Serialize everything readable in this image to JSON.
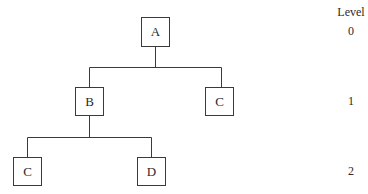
{
  "diagram": {
    "type": "tree",
    "nodes": [
      {
        "id": "A",
        "label": "A",
        "level": 0
      },
      {
        "id": "B",
        "label": "B",
        "level": 1
      },
      {
        "id": "C1",
        "label": "C",
        "level": 1
      },
      {
        "id": "C2",
        "label": "C",
        "level": 2
      },
      {
        "id": "D",
        "label": "D",
        "level": 2
      }
    ],
    "edges": [
      {
        "from": "A",
        "to": "B"
      },
      {
        "from": "A",
        "to": "C1"
      },
      {
        "from": "B",
        "to": "C2"
      },
      {
        "from": "B",
        "to": "D"
      }
    ],
    "level_axis": {
      "title": "Level",
      "levels": [
        "0",
        "1",
        "2"
      ]
    }
  }
}
